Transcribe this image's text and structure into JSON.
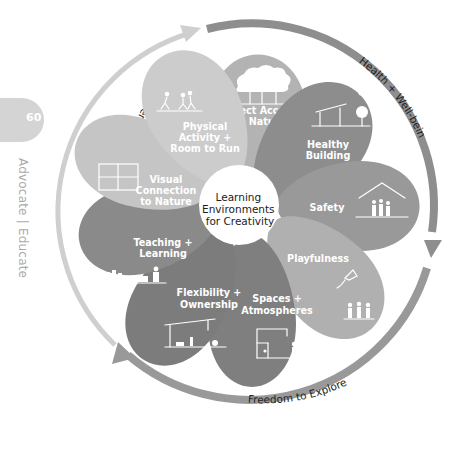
{
  "page": {
    "number": "60",
    "section": [
      "Advocate",
      "Educate"
    ],
    "separator": "|"
  },
  "diagram": {
    "center_label": [
      "Learning",
      "Environments",
      "for Creativity"
    ],
    "colors": {
      "dark_arc": "#8e8e8e",
      "light_arc": "#cfcfcf",
      "petal_dark": "#8a8a8a",
      "petal_mid": "#a5a5a5",
      "petal_light": "#cccccc",
      "page_tab": "#d4d4d4",
      "section_text": "#aaaaaa"
    },
    "cycle_labels": {
      "health": "Health + Well-being",
      "freedom": "Freedom to Explore",
      "interest": "Interest + Curiosity"
    },
    "petals": [
      {
        "id": "direct-access",
        "lines": [
          "Direct Access",
          "to Nature"
        ],
        "icon": "tree-icon"
      },
      {
        "id": "healthy-building",
        "lines": [
          "Healthy",
          "Building"
        ],
        "icon": "building-sun-tree-icon"
      },
      {
        "id": "safety",
        "lines": [
          "Safety"
        ],
        "icon": "house-family-icon"
      },
      {
        "id": "playfulness",
        "lines": [
          "Playfulness"
        ],
        "icon": "kite-children-icon"
      },
      {
        "id": "spaces-atmospheres",
        "lines": [
          "Spaces +",
          "Atmospheres"
        ],
        "icon": "room-people-icon"
      },
      {
        "id": "flexibility-ownership",
        "lines": [
          "Flexibility +",
          "Ownership"
        ],
        "icon": "canopy-play-icon"
      },
      {
        "id": "teaching-learning",
        "lines": [
          "Teaching +",
          "Learning"
        ],
        "icon": "classroom-icon"
      },
      {
        "id": "visual-connection",
        "lines": [
          "Visual",
          "Connection",
          "to Nature"
        ],
        "icon": "window-icon"
      },
      {
        "id": "physical-activity",
        "lines": [
          "Physical",
          "Activity +",
          "Room to Run"
        ],
        "icon": "running-children-icon"
      }
    ]
  }
}
